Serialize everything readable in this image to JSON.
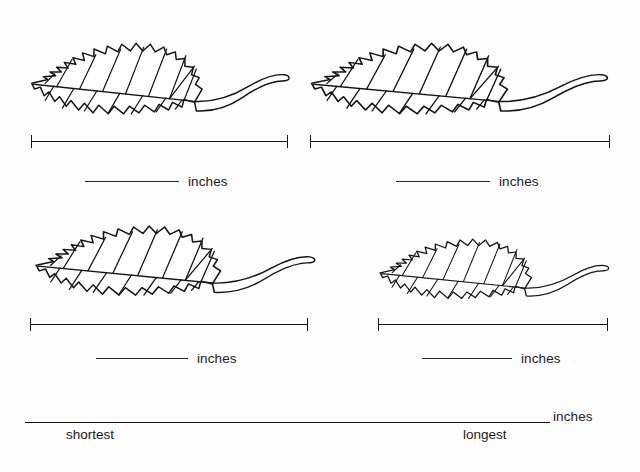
{
  "worksheet": {
    "background_color": "#fdfdfd",
    "ink_color": "#141414",
    "unit_label": "inches"
  },
  "leaf_items": [
    {
      "id": "leaf-1",
      "position": "top-left",
      "icon": "leaf-icon",
      "measure_bar_name": "measurement-bar-1",
      "answer_blank_name": "answer-blank-1",
      "unit": "inches",
      "value": ""
    },
    {
      "id": "leaf-2",
      "position": "top-right",
      "icon": "leaf-icon",
      "measure_bar_name": "measurement-bar-2",
      "answer_blank_name": "answer-blank-2",
      "unit": "inches",
      "value": ""
    },
    {
      "id": "leaf-3",
      "position": "bottom-left",
      "icon": "leaf-icon",
      "measure_bar_name": "measurement-bar-3",
      "answer_blank_name": "answer-blank-3",
      "unit": "inches",
      "value": ""
    },
    {
      "id": "leaf-4",
      "position": "bottom-right",
      "icon": "leaf-icon",
      "measure_bar_name": "measurement-bar-4",
      "answer_blank_name": "answer-blank-4",
      "unit": "inches",
      "value": ""
    }
  ],
  "ordering_section": {
    "unit": "inches",
    "left_label": "shortest",
    "right_label": "longest",
    "value": ""
  }
}
